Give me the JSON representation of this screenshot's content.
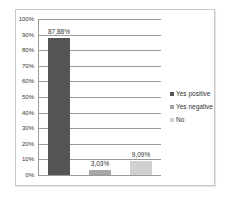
{
  "chart_data": {
    "type": "bar",
    "title": "",
    "xlabel": "",
    "ylabel": "",
    "ylim": [
      0,
      100
    ],
    "yticks": [
      "0%",
      "10%",
      "20%",
      "30%",
      "40%",
      "50%",
      "60%",
      "70%",
      "80%",
      "90%",
      "100%"
    ],
    "grid": true,
    "legend_position": "right",
    "categories": [
      "Yes positive",
      "Yes negative",
      "No"
    ],
    "values": [
      87.88,
      3.03,
      9.09
    ],
    "data_labels": [
      "87,88%",
      "3,03%",
      "9,09%"
    ],
    "colors": [
      "#555555",
      "#a6a6a6",
      "#d0d0d0"
    ]
  },
  "legend": {
    "items": [
      {
        "label": "Yes positive",
        "color": "#555555"
      },
      {
        "label": "Yes negative",
        "color": "#a6a6a6"
      },
      {
        "label": "No",
        "color": "#d0d0d0"
      }
    ]
  }
}
